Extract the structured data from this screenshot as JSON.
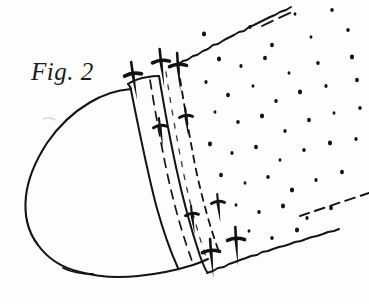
{
  "figure": {
    "label": "Fig. 2",
    "caption_style": "italic-serif",
    "domain": "technical line drawing",
    "background_color": "#fdfdfb",
    "ink_color": "#111111",
    "stroke_color": "#1a1a1a",
    "canvas": {
      "width": 369,
      "height": 304
    }
  },
  "chart_data": {
    "type": "scatter",
    "title": "Fig. 2",
    "xlabel": "",
    "ylabel": "",
    "xlim": [
      0,
      369
    ],
    "ylim": [
      0,
      304
    ],
    "grid": false,
    "legend": "none",
    "annotations": [
      "Fig. 2"
    ],
    "series": [
      {
        "name": "stipple-dots",
        "marker": "dot",
        "color": "#111111",
        "points": [
          [
            295,
            14
          ],
          [
            332,
            10
          ],
          [
            204,
            34
          ],
          [
            250,
            27
          ],
          [
            272,
            45
          ],
          [
            311,
            37
          ],
          [
            348,
            30
          ],
          [
            219,
            59
          ],
          [
            241,
            66
          ],
          [
            265,
            58
          ],
          [
            289,
            73
          ],
          [
            318,
            63
          ],
          [
            352,
            57
          ],
          [
            206,
            82
          ],
          [
            228,
            95
          ],
          [
            253,
            86
          ],
          [
            276,
            101
          ],
          [
            300,
            92
          ],
          [
            326,
            86
          ],
          [
            357,
            80
          ],
          [
            215,
            112
          ],
          [
            238,
            122
          ],
          [
            262,
            116
          ],
          [
            285,
            131
          ],
          [
            309,
            120
          ],
          [
            334,
            113
          ],
          [
            360,
            108
          ],
          [
            210,
            144
          ],
          [
            232,
            153
          ],
          [
            256,
            147
          ],
          [
            280,
            160
          ],
          [
            304,
            150
          ],
          [
            330,
            143
          ],
          [
            356,
            139
          ],
          [
            221,
            175
          ],
          [
            245,
            183
          ],
          [
            268,
            177
          ],
          [
            292,
            190
          ],
          [
            316,
            180
          ],
          [
            342,
            172
          ],
          [
            236,
            205
          ],
          [
            259,
            212
          ],
          [
            283,
            206
          ],
          [
            307,
            218
          ],
          [
            331,
            208
          ],
          [
            249,
            231
          ],
          [
            272,
            238
          ],
          [
            297,
            230
          ]
        ]
      }
    ],
    "paths": [
      {
        "name": "body-outline",
        "description": "teardrop / rounded toe-cap body on the left",
        "closed": false,
        "style": "solid"
      },
      {
        "name": "band-left-edge",
        "description": "solid left edge of the attachment band",
        "style": "solid"
      },
      {
        "name": "band-right-edge",
        "description": "solid right edge of the attachment band",
        "style": "solid"
      },
      {
        "name": "band-stitch-line-inner",
        "description": "dashed stitch line inside band",
        "style": "dashed"
      },
      {
        "name": "band-stitch-line-outer",
        "description": "dashed stitch line at fabric junction",
        "style": "dashed"
      },
      {
        "name": "fabric-top-edge",
        "description": "ragged upper boundary of stippled fabric panel",
        "style": "ragged"
      },
      {
        "name": "fabric-bottom-edge",
        "description": "ragged lower boundary of stippled fabric panel",
        "style": "ragged"
      }
    ],
    "tacks": [
      {
        "id": 1,
        "x": 133,
        "y": 75,
        "angle": -8,
        "size": "large"
      },
      {
        "id": 2,
        "x": 161,
        "y": 62,
        "angle": -6,
        "size": "large"
      },
      {
        "id": 3,
        "x": 178,
        "y": 66,
        "angle": -4,
        "size": "large"
      },
      {
        "id": 4,
        "x": 160,
        "y": 127,
        "angle": -7,
        "size": "medium"
      },
      {
        "id": 5,
        "x": 186,
        "y": 117,
        "angle": -5,
        "size": "medium"
      },
      {
        "id": 6,
        "x": 192,
        "y": 215,
        "angle": -6,
        "size": "medium"
      },
      {
        "id": 7,
        "x": 218,
        "y": 203,
        "angle": -5,
        "size": "medium"
      },
      {
        "id": 8,
        "x": 211,
        "y": 252,
        "angle": -4,
        "size": "large"
      },
      {
        "id": 9,
        "x": 236,
        "y": 240,
        "angle": -3,
        "size": "large"
      }
    ]
  }
}
